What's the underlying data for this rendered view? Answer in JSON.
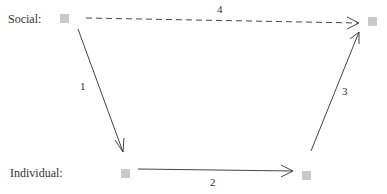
{
  "rows": {
    "social": "Social:",
    "individual": "Individual:"
  },
  "edges": [
    {
      "id": "1",
      "label": "1",
      "from": "social-left",
      "to": "individual-left",
      "style": "solid"
    },
    {
      "id": "2",
      "label": "2",
      "from": "individual-left",
      "to": "individual-right",
      "style": "solid"
    },
    {
      "id": "3",
      "label": "3",
      "from": "individual-right",
      "to": "social-right",
      "style": "solid"
    },
    {
      "id": "4",
      "label": "4",
      "from": "social-left",
      "to": "social-right",
      "style": "dashed"
    }
  ],
  "colors": {
    "node": "#c9c9c9",
    "line": "#444444",
    "text": "#333333"
  }
}
